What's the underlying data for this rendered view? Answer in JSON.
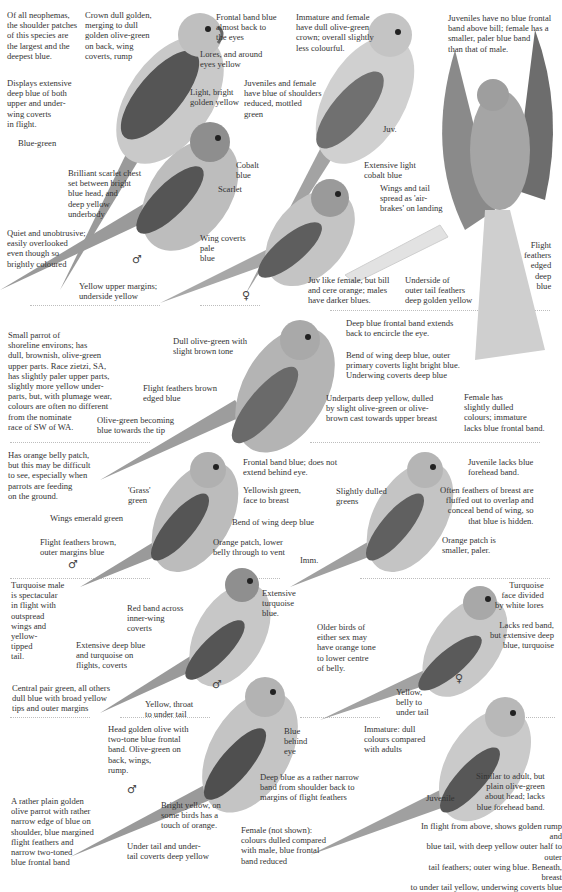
{
  "page": {
    "type": "field-guide plate",
    "palette": {
      "background": "#ffffff",
      "text": "#333333",
      "ink": "#4a4a4a",
      "separator": "#bdbdbd"
    }
  },
  "sections": [
    {
      "id": "blue-winged-style-row1",
      "notes": {
        "intro": "Of all neophemas,\nthe shoulder patches\nof this species are\nthe largest and the\ndeepest blue.",
        "crown": "Crown dull golden,\nmerging to dull\ngolden olive-green\non back, wing\ncoverts, rump",
        "frontal": "Frontal band blue\nalmost back to\nthe eyes",
        "lores": "Lores, and around\neyes yellow",
        "flight": "Displays extensive\ndeep blue of both\nupper and under-\nwing coverts\nin flight.",
        "belly": "Light, bright\ngolden yellow",
        "tail": "Blue-green",
        "imm_female": "Immature and female\nhave dull olive-green\ncrown; overall slightly\nless colourful.",
        "juv_female": "Juveniles and female\nhave blue of shoulders\nreduced, mottled\ngreen",
        "juv_label": "Juv.",
        "juv_note": "Juveniles have no blue frontal\nband above bill; female has a\nsmaller, paler blue band\nthan that of male."
      }
    },
    {
      "id": "scarlet-chested",
      "notes": {
        "chest": "Brilliant scarlet chest\nset between bright\nblue head, and\ndeep yellow\nunderbody",
        "cobalt": "Cobalt\nblue",
        "scarlet": "Scarlet",
        "quiet": "Quiet and unobtrusive;\neasily overlooked\neven though so\nbrightly coloured",
        "tail": "Yellow upper margins;\nunderside yellow",
        "male_symbol": "♂",
        "ext_cobalt": "Extensive light\ncobalt blue",
        "wings_tail": "Wings and tail\nspread as 'air-\nbrakes' on landing",
        "coverts": "Wing coverts\npale\nblue",
        "female_symbol": "♀",
        "juv": "Juv like female, but bill\nand cere orange; males\nhave darker blues.",
        "underside": "Underside of\nouter tail feathers\ndeep golden yellow",
        "flight_feathers": "Flight\nfeathers\nedged\ndeep\nblue"
      }
    },
    {
      "id": "rock-parrot",
      "notes": {
        "intro": "Small parrot of\nshoreline environs; has\ndull, brownish, olive-green\nupper parts.  Race zietzi, SA,\nhas slightly paler upper parts,\nslightly more yellow under-\nparts, but, with plumage wear,\ncolours are often no different\nfrom the nominate\nrace of SW of WA.",
        "olive": "Dull olive-green with\nslight brown tone",
        "flight": "Flight feathers brown\nedged blue",
        "tail": "Olive-green becoming\nblue towards the tip",
        "frontal": "Deep blue frontal band extends\nback to encircle the eye.",
        "wing": "Bend of wing deep blue, outer\nprimary coverts light bright blue.\nUnderwing coverts deep blue",
        "underparts": "Underparts deep yellow, dulled\nby slight olive-green or olive-\nbrown cast towards upper breast",
        "female": "Female has\nslightly dulled\ncolours; immature\nlacks blue frontal band."
      }
    },
    {
      "id": "orange-bellied",
      "notes": {
        "intro": "Has orange belly patch,\nbut this may be difficult\nto see, especially when\nparrots are feeding\non the ground.",
        "grass": "'Grass'\ngreen",
        "wings": "Wings emerald green",
        "flight": "Flight feathers brown,\nouter margins blue",
        "male_symbol": "♂",
        "frontal": "Frontal band blue; does not\nextend behind eye.",
        "face": "Yellowish green,\nface to breast",
        "bend": "Bend of wing deep blue",
        "orange": "Orange patch, lower\nbelly through to vent",
        "dulled": "Slightly dulled\ngreens",
        "imm_label": "Imm.",
        "juv": "Juvenile lacks blue\nforehead band.",
        "breast": "Often feathers of breast are\nfluffed out to overlap and\nconceal bend of wing, so\nthat blue is hidden.",
        "orange_small": "Orange patch is\nsmaller, paler."
      }
    },
    {
      "id": "turquoise",
      "notes": {
        "intro": "Turquoise male\nis spectacular\nin flight with\noutspread\nwings and\nyellow-\ntipped\ntail.",
        "red_band": "Red band across\ninner-wing\ncoverts",
        "ext_blue": "Extensive deep blue\nand turquoise on\nflights, coverts",
        "tail": "Central pair green, all others\ndull blue with broad yellow\ntips and outer margins",
        "throat": "Yellow, throat\nto under tail",
        "male_symbol": "♂",
        "face_blue": "Extensive\nturquoise\nblue.",
        "older": "Older birds of\neither sex may\nhave orange tone\nto lower centre\nof belly.",
        "face_div": "Turquoise\nface divided\nby white lores",
        "lacks_red": "Lacks red band,\nbut extensive deep\nblue, turquoise",
        "belly": "Yellow,\nbelly to\nunder tail",
        "female_symbol": "♀"
      }
    },
    {
      "id": "elegant",
      "notes": {
        "head": "Head golden olive with\ntwo-tone blue frontal\nband.  Olive-green on\nback, wings,\nrump.",
        "blue_eye": "Blue\nbehind\neye",
        "imm": "Immature: dull\ncolours compared\nwith adults",
        "male_symbol": "♂",
        "intro": "A rather plain golden\nolive parrot with rather\nnarrow edge of blue on\nshoulder, blue margined\nflight feathers and\nnarrow two-toned\nblue frontal band",
        "bright": "Bright yellow, on\nsome birds has a\ntouch of orange.",
        "deep_blue": "Deep blue as a rather narrow\nband from shoulder back to\nmargins of flight feathers",
        "undertail": "Under tail and under-\ntail coverts deep yellow",
        "female": "Female (not shown):\ncolours dulled compared\nwith male, blue frontal\nband reduced",
        "juv_label": "Juvenile",
        "juv": "Similar to adult, but\nplain olive-green\nabout head; lacks\nblue forehead band.",
        "flight": "In flight from above, shows golden rump and\nblue tail, with deep yellow outer half to outer\ntail feathers; outer wing blue. Beneath, breast\nto under tail yellow, underwing coverts blue"
      }
    }
  ]
}
